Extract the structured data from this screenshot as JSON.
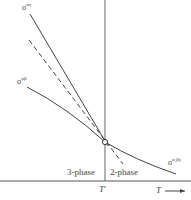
{
  "diagram": {
    "type": "phase-tension diagram",
    "curves": [
      {
        "id": "sigma-alpha-gamma",
        "symbol": "σ",
        "superscript": "αγ",
        "style": "solid"
      },
      {
        "id": "sigma-alpha-beta",
        "symbol": "σ",
        "superscript": "αβ",
        "style": "solid"
      },
      {
        "id": "sigma-alpha-betagamma",
        "symbol": "σ",
        "superscript": "α,βγ",
        "style": "solid"
      },
      {
        "id": "extrapolation",
        "style": "dashed"
      }
    ],
    "regions": {
      "left": "3-phase",
      "right": "2-phase"
    },
    "x_axis": {
      "label": "T",
      "arrow": "→",
      "critical_tick": "T",
      "critical_sup": "c"
    },
    "colors": {
      "line": "#444444",
      "background": "#ffffff"
    }
  }
}
